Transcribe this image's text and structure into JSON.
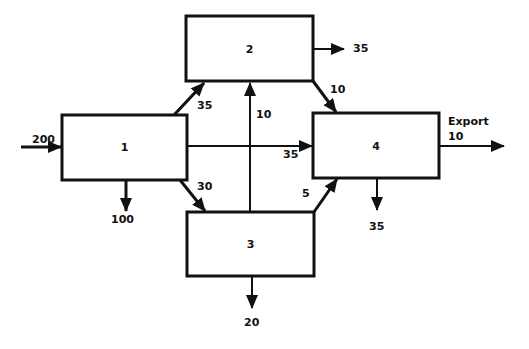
{
  "diagram": {
    "type": "flow-diagram",
    "nodes": [
      {
        "id": "1",
        "label": "1"
      },
      {
        "id": "2",
        "label": "2"
      },
      {
        "id": "3",
        "label": "3"
      },
      {
        "id": "4",
        "label": "4"
      }
    ],
    "flows": [
      {
        "from": "input",
        "to": "1",
        "value": "200"
      },
      {
        "from": "1",
        "to": "out",
        "value": "100"
      },
      {
        "from": "1",
        "to": "2",
        "value": "35"
      },
      {
        "from": "1",
        "to": "3",
        "value": "30"
      },
      {
        "from": "1",
        "to": "4",
        "value": "35"
      },
      {
        "from": "3",
        "to": "2",
        "value": "10"
      },
      {
        "from": "2",
        "to": "out",
        "value": "35"
      },
      {
        "from": "2",
        "to": "4",
        "value": "10"
      },
      {
        "from": "3",
        "to": "4",
        "value": "5"
      },
      {
        "from": "3",
        "to": "out",
        "value": "20"
      },
      {
        "from": "4",
        "to": "out",
        "value": "35"
      },
      {
        "from": "4",
        "to": "export",
        "value": "10"
      }
    ],
    "export_label": "Export",
    "colors": {
      "stroke": "#111111",
      "background": "#ffffff"
    }
  }
}
